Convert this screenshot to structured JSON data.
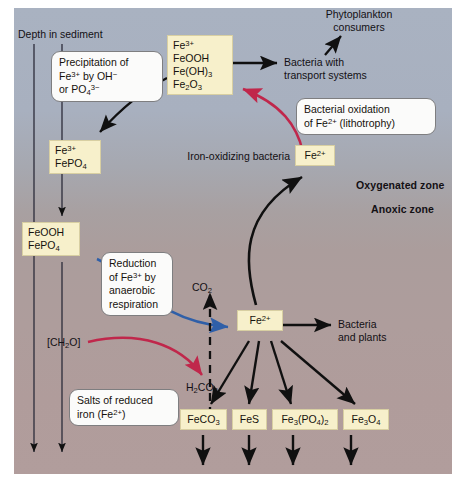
{
  "figure": {
    "title_axis": "Depth in sediment",
    "zones": {
      "oxygenated": "Oxygenated zone",
      "anoxic": "Anoxic zone"
    },
    "colors": {
      "background_top": "#a9b2c1",
      "background_bottom": "#b19d9c",
      "chem_box_fill": "#f7f0cb",
      "chem_box_border": "#d8cfa2",
      "callout_fill": "#fbfbfa",
      "callout_border": "#7e7e80",
      "arrow_black": "#101010",
      "arrow_red": "#c0274b",
      "arrow_blue": "#2f5fa8"
    }
  },
  "chem_boxes": {
    "ferric_species": [
      "Fe3+",
      "FeOOH",
      "Fe(OH)3",
      "Fe2O3"
    ],
    "ferric_phosphate": [
      "Fe3+",
      "FePO4"
    ],
    "feooh_fepo4": [
      "FeOOH",
      "FePO4"
    ],
    "ferrous_oxic": "Fe2+",
    "ferrous_anoxic": "Fe2+",
    "minerals": [
      "FeCO3",
      "FeS",
      "Fe3(PO4)2",
      "Fe3O4"
    ]
  },
  "callouts": {
    "precipitation": "Precipitation of Fe3+ by OH- or PO4 3-",
    "bacterial_oxidation": "Bacterial oxidation of Fe2+ (lithotrophy)",
    "reduction": "Reduction of Fe3+ by anaerobic respiration",
    "salts": "Salts of reduced iron (Fe2+)"
  },
  "labels": {
    "phytoplankton": "Phytoplankton consumers",
    "bacteria_transport": "Bacteria with transport systems",
    "iron_oxidizing": "Iron-oxidizing bacteria",
    "bacteria_plants": "Bacteria and plants",
    "co2": "CO2",
    "h2co3": "H2CO3",
    "organic_matter": "[CH2O]"
  }
}
